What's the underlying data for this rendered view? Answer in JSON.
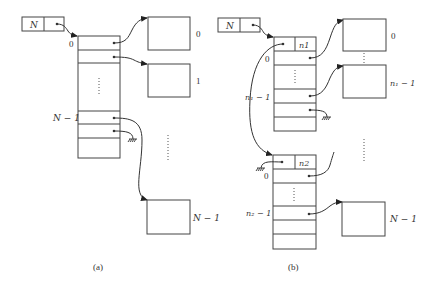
{
  "figure": {
    "a": {
      "caption": "(a)",
      "header_box": {
        "label": "N"
      },
      "array_labels": {
        "first": "0",
        "last": "N − 1"
      },
      "blocks": [
        {
          "label": "0"
        },
        {
          "label": "1"
        },
        {
          "label": "N − 1"
        }
      ],
      "ellipsis": "⋮"
    },
    "b": {
      "caption": "(b)",
      "header_box": {
        "label": "N"
      },
      "segment1": {
        "count_label": "n1",
        "row_labels": {
          "first": "0",
          "last": "n₁ − 1"
        },
        "blocks": [
          {
            "label": "0"
          },
          {
            "label": "n₁ − 1"
          }
        ]
      },
      "segment2": {
        "count_label": "n2",
        "row_labels": {
          "first": "0",
          "last": "n₂ − 1"
        },
        "blocks": [
          {
            "label": "N − 1"
          }
        ]
      },
      "ellipsis": "⋮"
    }
  },
  "colors": {
    "line": "#444444",
    "background": "#ffffff"
  }
}
